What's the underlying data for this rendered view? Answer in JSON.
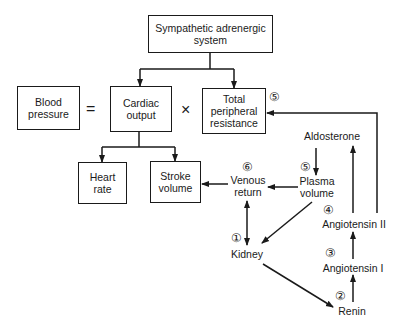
{
  "diagram": {
    "boxes": {
      "sympathetic": "Sympathetic adrenergic\nsystem",
      "blood_pressure": "Blood\npressure",
      "cardiac_output": "Cardiac\noutput",
      "tpr": "Total\nperipheral\nresistance",
      "heart_rate": "Heart\nrate",
      "stroke_volume": "Stroke\nvolume"
    },
    "operators": {
      "equals": "=",
      "times": "×"
    },
    "nodes": {
      "venous_return": "Venous\nreturn",
      "plasma_volume": "Plasma\nvolume",
      "aldosterone": "Aldosterone",
      "kidney": "Kidney",
      "angiotensin_ii": "Angiotensin II",
      "angiotensin_i": "Angiotensin I",
      "renin": "Renin"
    },
    "step_numbers": {
      "kidney": "①",
      "renin": "②",
      "angiotensin_i": "③",
      "angiotensin_ii": "④",
      "plasma_volume": "⑤",
      "tpr": "⑤",
      "venous_return": "⑥"
    },
    "edges": [
      {
        "from": "Sympathetic adrenergic system",
        "to": "Cardiac output"
      },
      {
        "from": "Sympathetic adrenergic system",
        "to": "Total peripheral resistance"
      },
      {
        "from": "Cardiac output",
        "to": "Heart rate"
      },
      {
        "from": "Cardiac output",
        "to": "Stroke volume"
      },
      {
        "from": "Venous return",
        "to": "Stroke volume"
      },
      {
        "from": "Plasma volume",
        "to": "Venous return"
      },
      {
        "from": "Aldosterone",
        "to": "Plasma volume"
      },
      {
        "from": "Plasma volume",
        "to": "Kidney"
      },
      {
        "from": "Venous return",
        "to": "Kidney",
        "bidirectional": true
      },
      {
        "from": "Kidney",
        "to": "Renin"
      },
      {
        "from": "Renin",
        "to": "Angiotensin I"
      },
      {
        "from": "Angiotensin I",
        "to": "Angiotensin II"
      },
      {
        "from": "Angiotensin II",
        "to": "Aldosterone"
      },
      {
        "from": "Angiotensin II",
        "to": "Total peripheral resistance"
      }
    ]
  }
}
